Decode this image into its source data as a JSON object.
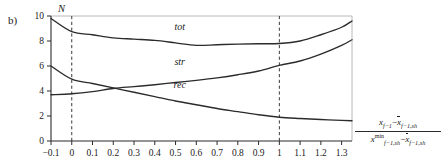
{
  "panel": {
    "label": "b)"
  },
  "chart_data": {
    "type": "line",
    "title": "",
    "ylabel": "N",
    "xlabel_numerator": "x_{f-1} - x̄_{f-1,sh}",
    "xlabel_denominator": "x^{min}_{f-1,sh} - x̄_{f-1,sh}",
    "xlim": [
      -0.1,
      1.35
    ],
    "ylim": [
      0,
      10
    ],
    "xticks": [
      -0.1,
      0,
      0.1,
      0.2,
      0.3,
      0.4,
      0.5,
      0.6,
      0.7,
      0.8,
      0.9,
      1,
      1.1,
      1.2,
      1.3
    ],
    "xticklabels": [
      "−0.1",
      "0",
      "0.1",
      "0.2",
      "0.3",
      "0.4",
      "0.5",
      "0.6",
      "0.7",
      "0.8",
      "0.9",
      "1",
      "1.1",
      "1.2",
      "1.3"
    ],
    "yticks": [
      0,
      2,
      4,
      6,
      8,
      10
    ],
    "yticklabels": [
      "0",
      "2",
      "4",
      "6",
      "8",
      "10"
    ],
    "grid": false,
    "legend": "inline-labels",
    "vlines": [
      0,
      1
    ],
    "x": [
      -0.1,
      0,
      0.1,
      0.2,
      0.3,
      0.4,
      0.5,
      0.6,
      0.7,
      0.8,
      0.9,
      1.0,
      1.1,
      1.2,
      1.3,
      1.35
    ],
    "series": [
      {
        "name": "tot",
        "label": "tot",
        "values": [
          9.8,
          8.75,
          8.5,
          8.25,
          8.15,
          8.05,
          7.85,
          7.65,
          7.7,
          7.75,
          7.78,
          7.8,
          8.0,
          8.5,
          9.1,
          9.6
        ],
        "label_x": 0.52,
        "label_y": 8.85
      },
      {
        "name": "str",
        "label": "str",
        "values": [
          3.7,
          3.78,
          3.95,
          4.2,
          4.35,
          4.5,
          4.68,
          4.85,
          5.05,
          5.3,
          5.6,
          6.05,
          6.4,
          6.95,
          7.65,
          8.1
        ],
        "label_x": 0.52,
        "label_y": 6.05
      },
      {
        "name": "rec",
        "label": "rec",
        "values": [
          6.0,
          4.95,
          4.6,
          4.25,
          3.9,
          3.55,
          3.2,
          2.9,
          2.6,
          2.35,
          2.1,
          1.9,
          1.8,
          1.72,
          1.65,
          1.62
        ],
        "label_x": 0.52,
        "label_y": 4.25
      }
    ]
  },
  "axis_label": {
    "num_x": "x",
    "num_sub1": "f−1",
    "num_minus": "−",
    "num_x2": "x",
    "num_sub2": "f−1,sh",
    "den_x": "x",
    "den_sup": "min",
    "den_sub1": "f−1,sh",
    "den_minus": "−",
    "den_x2": "x",
    "den_sub2": "f−1,sh"
  },
  "colors": {
    "curve": "#2b2b2b",
    "axis": "#2b2b2b",
    "frame": "#b8b8b8",
    "dashed": "#3a3a3a",
    "text": "#1a1a1a",
    "background": "#ffffff"
  }
}
